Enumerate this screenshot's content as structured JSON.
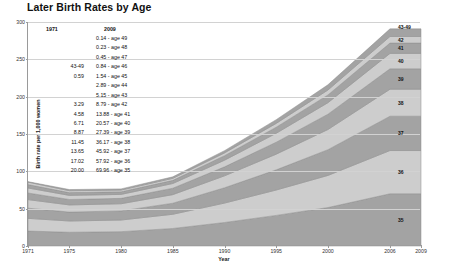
{
  "chart_data": {
    "type": "area",
    "title": "Later Birth Rates by Age",
    "xlabel": "Year",
    "ylabel": "Birth rate per 1,000 women",
    "xlim": [
      1971,
      2009
    ],
    "ylim": [
      0,
      300
    ],
    "grid": true,
    "stacked": true,
    "legend_position": "right",
    "x_ticks": [
      "1971",
      "1975",
      "1980",
      "1985",
      "1990",
      "1995",
      "2000",
      "2006",
      "2009"
    ],
    "x_tick_values": [
      1971,
      1975,
      1980,
      1985,
      1990,
      1995,
      2000,
      2006,
      2009
    ],
    "y_ticks": [
      "0",
      "50",
      "100",
      "150",
      "200",
      "250",
      "300"
    ],
    "y_tick_values": [
      0,
      50,
      100,
      150,
      200,
      250,
      300
    ],
    "x": [
      1971,
      1975,
      1980,
      1985,
      1990,
      1995,
      2000,
      2006,
      2009
    ],
    "series": [
      {
        "name": "35",
        "label": "35",
        "values": [
          20.0,
          18.4,
          19.2,
          23.5,
          31.5,
          41.0,
          51.5,
          69.96,
          69.96
        ]
      },
      {
        "name": "36",
        "label": "36",
        "values": [
          17.02,
          15.1,
          15.6,
          19.0,
          26.0,
          34.0,
          43.0,
          57.92,
          57.92
        ]
      },
      {
        "name": "37",
        "label": "37",
        "values": [
          13.65,
          11.9,
          12.2,
          14.8,
          20.5,
          27.0,
          34.5,
          45.92,
          45.92
        ]
      },
      {
        "name": "38",
        "label": "38",
        "values": [
          11.45,
          9.6,
          9.6,
          11.5,
          16.0,
          21.0,
          27.0,
          36.17,
          36.17
        ]
      },
      {
        "name": "39",
        "label": "39",
        "values": [
          8.87,
          7.3,
          7.2,
          8.6,
          12.0,
          16.0,
          20.5,
          27.39,
          27.39
        ]
      },
      {
        "name": "40",
        "label": "40",
        "values": [
          6.71,
          5.5,
          5.3,
          6.3,
          8.9,
          12.0,
          15.4,
          20.57,
          20.57
        ]
      },
      {
        "name": "41",
        "label": "41",
        "values": [
          4.58,
          3.7,
          3.5,
          4.2,
          6.0,
          8.1,
          10.4,
          13.88,
          13.88
        ]
      },
      {
        "name": "42",
        "label": "42",
        "values": [
          3.29,
          2.5,
          2.3,
          2.7,
          3.8,
          5.1,
          6.6,
          8.79,
          8.79
        ]
      },
      {
        "name": "43-49",
        "label": "43-49",
        "values": [
          0.59,
          1.6,
          1.6,
          2.0,
          3.0,
          5.0,
          7.0,
          10.2,
          10.2
        ]
      }
    ],
    "series_labels_right": [
      "43-49",
      "42",
      "41",
      "40",
      "39",
      "38",
      "37",
      "36",
      "35"
    ],
    "colors": {
      "band_light": "#cdcdcd",
      "band_dark": "#a3a3a3",
      "band_edge": "#8f8f8f",
      "grid": "#d2d2d2",
      "axis": "#9a9a9a"
    }
  },
  "table": {
    "header_1971": "1971",
    "header_2009": "2009",
    "rows": [
      {
        "y1971": "",
        "y2009": "0.14 - age 49"
      },
      {
        "y1971": "",
        "y2009": "0.23 - age 48"
      },
      {
        "y1971": "",
        "y2009": "0.45 - age 47"
      },
      {
        "y1971": "43-49",
        "y2009": "0.84 - age 46"
      },
      {
        "y1971": "0.59",
        "y2009": "1.54 - age 45"
      },
      {
        "y1971": "",
        "y2009": "2.89 - age 44"
      },
      {
        "y1971": "",
        "y2009": "5.15 - age 43"
      },
      {
        "y1971": "3.29",
        "y2009": "8.79 - age 42"
      },
      {
        "y1971": "4.58",
        "y2009": "13.88 - age 41"
      },
      {
        "y1971": "6.71",
        "y2009": "20.57 - age 40"
      },
      {
        "y1971": "8.87",
        "y2009": "27.39 - age 39"
      },
      {
        "y1971": "11.45",
        "y2009": "36.17 - age 38"
      },
      {
        "y1971": "13.65",
        "y2009": "45.92 - age 37"
      },
      {
        "y1971": "17.02",
        "y2009": "57.92 - age 36"
      },
      {
        "y1971": "20.00",
        "y2009": "69.96 - age 35"
      }
    ]
  }
}
